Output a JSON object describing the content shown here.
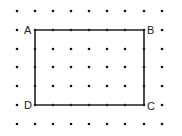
{
  "diagram": {
    "type": "dot-grid-rectangle",
    "grid": {
      "columns_x": [
        17,
        35,
        53,
        71,
        89,
        107,
        125,
        144,
        162
      ],
      "rows_y": [
        11,
        30,
        49,
        67,
        86,
        105,
        124
      ],
      "dot_radius": 1.3,
      "dot_color": "#111111"
    },
    "rectangle": {
      "stroke_color": "#222222",
      "stroke_width": 1.6,
      "corners": [
        {
          "label": "A",
          "col": 1,
          "row": 1,
          "label_dx": -11,
          "label_dy": 4
        },
        {
          "label": "B",
          "col": 7,
          "row": 1,
          "label_dx": 3,
          "label_dy": 4
        },
        {
          "label": "C",
          "col": 7,
          "row": 5,
          "label_dx": 3,
          "label_dy": 5
        },
        {
          "label": "D",
          "col": 1,
          "row": 5,
          "label_dx": -11,
          "label_dy": 4
        }
      ]
    }
  }
}
